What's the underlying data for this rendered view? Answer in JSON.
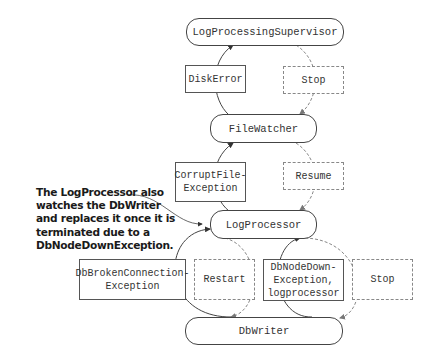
{
  "nodes": {
    "supervisor": "LogProcessingSupervisor",
    "file_watcher": "FileWatcher",
    "log_processor": "LogProcessor",
    "db_writer": "DbWriter"
  },
  "messages": {
    "disk_error": "DiskError",
    "stop_top": "Stop",
    "corrupt_file": "CorruptFile-\nException",
    "resume": "Resume",
    "db_broken": "DbBrokenConnection-\nException",
    "restart": "Restart",
    "db_node_down": "DbNodeDown-\nException,\nlogprocessor",
    "stop_bottom": "Stop"
  },
  "annotation": "The LogProcessor also watches the DbWriter and replaces it once it is terminated due to a DbNodeDownException."
}
